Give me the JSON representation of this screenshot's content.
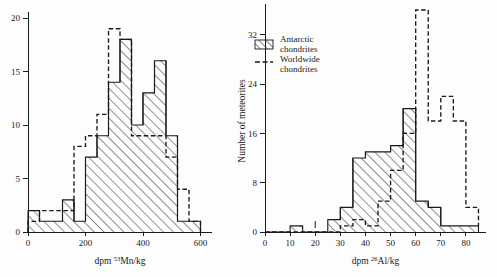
{
  "figure": {
    "background": "#fdfdfd",
    "ink_color": "#1a1a1a"
  },
  "legend": {
    "position": "right-panel-top-left",
    "entries": [
      {
        "swatch": "hatch-swatch",
        "line1": "Antarctic",
        "line2": "chondrites"
      },
      {
        "swatch": "dashed-line-swatch",
        "line1": "Worldwide",
        "line2": "chondrites"
      }
    ]
  },
  "shared": {
    "ylabel": "Number of meteorites",
    "series_names": [
      "Antarctic chondrites",
      "Worldwide chondrites"
    ]
  },
  "chart_data": [
    {
      "id": "mn53",
      "type": "bar",
      "title": "",
      "xlabel_prefix": "dpm ",
      "xlabel_sup": "53",
      "xlabel_suffix": "Mn/kg",
      "xlabel": "dpm 53Mn/kg",
      "ylabel": "",
      "bin_width": 40,
      "bin_edges": [
        0,
        40,
        80,
        120,
        160,
        200,
        240,
        280,
        320,
        360,
        400,
        440,
        480,
        520,
        560,
        600
      ],
      "xlim": [
        0,
        640
      ],
      "ylim": [
        0,
        20
      ],
      "xticks": [
        0,
        200,
        400,
        600
      ],
      "xtick_labels": [
        "0",
        "200",
        "400",
        "600"
      ],
      "yticks": [
        0,
        5,
        10,
        15,
        20
      ],
      "ytick_labels": [
        "0",
        "5",
        "10",
        "15",
        "20"
      ],
      "grid": false,
      "series": [
        {
          "name": "Antarctic chondrites",
          "style": "hatched-solid",
          "values": [
            2,
            1,
            1,
            3,
            1,
            7,
            9,
            14,
            18,
            10,
            13,
            16,
            9,
            1,
            1
          ]
        },
        {
          "name": "Worldwide chondrites",
          "style": "dashed",
          "values": [
            1,
            2,
            2,
            2,
            8,
            9,
            11,
            19,
            18,
            9,
            9,
            9,
            7,
            4,
            1
          ]
        }
      ]
    },
    {
      "id": "al26",
      "type": "bar",
      "title": "",
      "xlabel_prefix": "dpm ",
      "xlabel_sup": "26",
      "xlabel_suffix": "Al/kg",
      "xlabel": "dpm 26Al/kg",
      "ylabel": "Number of meteorites",
      "bin_width": 5,
      "bin_edges": [
        0,
        5,
        10,
        15,
        20,
        25,
        30,
        35,
        40,
        45,
        50,
        55,
        60,
        65,
        70,
        75,
        80,
        85
      ],
      "xlim": [
        0,
        88
      ],
      "ylim": [
        0,
        36
      ],
      "xticks": [
        0,
        10,
        20,
        30,
        40,
        50,
        60,
        70,
        80
      ],
      "xtick_labels": [
        "0",
        "10",
        "20",
        "30",
        "40",
        "50",
        "60",
        "70",
        "80"
      ],
      "yticks": [
        0,
        8,
        16,
        24,
        32
      ],
      "ytick_labels": [
        "0",
        "8",
        "16",
        "24",
        "32"
      ],
      "grid": false,
      "series": [
        {
          "name": "Antarctic chondrites",
          "style": "hatched-solid",
          "values": [
            0,
            0,
            1,
            0,
            0,
            2,
            4,
            12,
            13,
            13,
            14,
            20,
            5,
            4,
            1,
            1,
            1
          ]
        },
        {
          "name": "Worldwide chondrites",
          "style": "dashed",
          "values": [
            0,
            0,
            0,
            0,
            0,
            0,
            1,
            2,
            1,
            5,
            10,
            16,
            36,
            18,
            22,
            18,
            4,
            1
          ]
        }
      ]
    }
  ]
}
